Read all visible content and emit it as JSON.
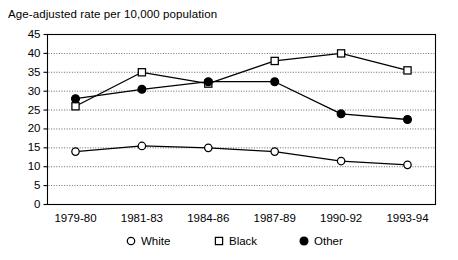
{
  "chart_data": {
    "type": "line",
    "title": "Age-adjusted rate per 10,000 population",
    "xlabel": "",
    "ylabel": "",
    "categories": [
      "1979-80",
      "1981-83",
      "1984-86",
      "1987-89",
      "1990-92",
      "1993-94"
    ],
    "ylim": [
      0,
      45
    ],
    "ytick_step": 5,
    "yticks": [
      "0",
      "5",
      "10",
      "15",
      "20",
      "25",
      "30",
      "35",
      "40",
      "45"
    ],
    "grid": true,
    "grid_axis": "y",
    "legend_position": "bottom",
    "series": [
      {
        "name": "White",
        "marker": "open-circle",
        "color": "#000000",
        "values": [
          14.0,
          15.5,
          15.0,
          14.0,
          11.5,
          10.5
        ]
      },
      {
        "name": "Black",
        "marker": "open-square",
        "color": "#000000",
        "values": [
          26.0,
          35.0,
          32.0,
          38.0,
          40.0,
          35.5
        ]
      },
      {
        "name": "Other",
        "marker": "filled-circle",
        "color": "#000000",
        "values": [
          28.0,
          30.5,
          32.5,
          32.5,
          24.0,
          22.5
        ]
      }
    ]
  },
  "legend": {
    "items": [
      {
        "label": "White",
        "marker": "open-circle"
      },
      {
        "label": "Black",
        "marker": "open-square"
      },
      {
        "label": "Other",
        "marker": "filled-circle"
      }
    ]
  }
}
